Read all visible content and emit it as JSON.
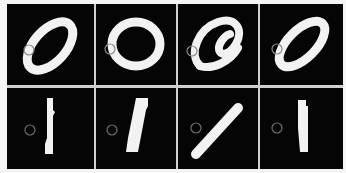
{
  "figure": {
    "rows": 2,
    "cols": 4,
    "background": "#050505",
    "digit_color": "#f2f2f2",
    "marker_color": "#8a8a8a",
    "row_labels": [
      "digit 0",
      "digit 1"
    ],
    "cells": [
      {
        "row": 0,
        "col": 0,
        "digit": "0",
        "style": "slanted-oval"
      },
      {
        "row": 0,
        "col": 1,
        "digit": "0",
        "style": "round"
      },
      {
        "row": 0,
        "col": 2,
        "digit": "0",
        "style": "curled"
      },
      {
        "row": 0,
        "col": 3,
        "digit": "0",
        "style": "slanted-oval"
      },
      {
        "row": 1,
        "col": 0,
        "digit": "1",
        "style": "vertical"
      },
      {
        "row": 1,
        "col": 1,
        "digit": "1",
        "style": "slight-slant"
      },
      {
        "row": 1,
        "col": 2,
        "digit": "1",
        "style": "diagonal"
      },
      {
        "row": 1,
        "col": 3,
        "digit": "1",
        "style": "vertical"
      }
    ]
  }
}
